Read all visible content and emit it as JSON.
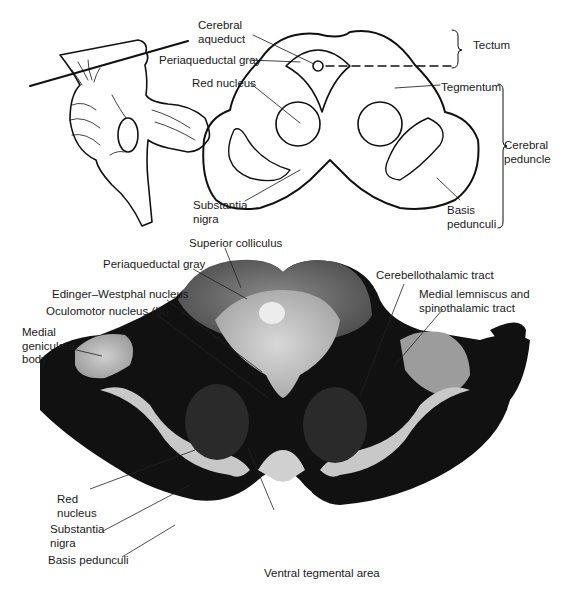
{
  "figure": {
    "top_panel": {
      "name": "Midbrain cross-section schematic",
      "labels": {
        "cerebral_aqueduct_1": "Cerebral",
        "cerebral_aqueduct_2": "aqueduct",
        "periaqueductal_gray": "Periaqueductal gray",
        "red_nucleus": "Red nucleus",
        "substantia_nigra_1": "Substantia",
        "substantia_nigra_2": "nigra",
        "tectum": "Tectum",
        "tegmentum": "Tegmentum",
        "cerebral_peduncle_1": "Cerebral",
        "cerebral_peduncle_2": "peduncle",
        "basis_pedunculi_1": "Basis",
        "basis_pedunculi_2": "pedunculi"
      }
    },
    "bottom_panel": {
      "name": "Stained midbrain section",
      "labels": {
        "superior_colliculus": "Superior colliculus",
        "periaqueductal_gray": "Periaqueductal gray",
        "edinger_westphal": "Edinger–Westphal nucleus",
        "oculomotor_nucleus": "Oculomotor nucleus (III)",
        "medial_geniculate_1": "Medial",
        "medial_geniculate_2": "geniculate",
        "medial_geniculate_3": "body",
        "cerebellothalamic": "Cerebellothalamic tract",
        "medial_lemniscus_1": "Medial lemniscus and",
        "medial_lemniscus_2": "spinothalamic tract",
        "red_nucleus_1": "Red",
        "red_nucleus_2": "nucleus",
        "substantia_nigra_1": "Substantia",
        "substantia_nigra_2": "nigra",
        "basis_pedunculi": "Basis pedunculi",
        "ventral_tegmental_area": "Ventral tegmental area"
      }
    }
  }
}
